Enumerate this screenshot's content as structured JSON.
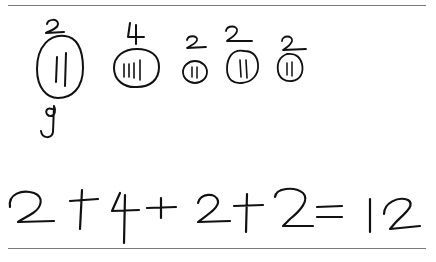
{
  "worksheet": {
    "groups": [
      {
        "label": "2",
        "tallies": 2,
        "below": "9"
      },
      {
        "label": "4",
        "tallies": 4
      },
      {
        "label": "2",
        "tallies": 2
      },
      {
        "label": "2",
        "tallies": 2
      },
      {
        "label": "2",
        "tallies": 2
      }
    ],
    "equation": {
      "terms": [
        "2",
        "4",
        "2",
        "2"
      ],
      "operator": "+",
      "equals": "=",
      "result": "12",
      "text": "2 + 4 + 2 + 2 = 12"
    }
  }
}
